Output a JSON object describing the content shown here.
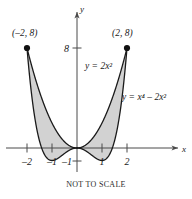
{
  "figure": {
    "caption": "NOT TO SCALE",
    "axes": {
      "x_axis_label": "x",
      "y_axis_label": "y",
      "x_ticks": [
        {
          "value": -2,
          "label": "–2"
        },
        {
          "value": -1,
          "label": "–1"
        },
        {
          "value": 1,
          "label": "1"
        },
        {
          "value": 2,
          "label": "2"
        }
      ],
      "y_ticks": [
        {
          "value": 8,
          "label": "8"
        },
        {
          "value": -1,
          "label": "–1"
        }
      ]
    },
    "curve_labels": {
      "parabola": "y = 2x²",
      "quartic": "y = x⁴ – 2x²"
    },
    "points": [
      {
        "label": "(–2, 8)",
        "x": -2,
        "y": 8
      },
      {
        "label": "(2, 8)",
        "x": 2,
        "y": 8
      }
    ],
    "colors": {
      "shading": "#d2d2d2",
      "curve": "#1a1a1a",
      "axis": "#4a4a4a"
    }
  },
  "chart_data": {
    "type": "line",
    "title": "",
    "subtitle": "NOT TO SCALE",
    "xlabel": "x",
    "ylabel": "y",
    "xlim": [
      -2.6,
      2.6
    ],
    "ylim": [
      -1.6,
      9.2
    ],
    "grid": false,
    "legend": "inline-curve-labels",
    "x": [
      -2,
      -1.75,
      -1.5,
      -1.25,
      -1,
      -0.75,
      -0.5,
      -0.25,
      0,
      0.25,
      0.5,
      0.75,
      1,
      1.25,
      1.5,
      1.75,
      2
    ],
    "series": [
      {
        "name": "y = 2x²",
        "expression": "2*x^2",
        "values": [
          8,
          6.125,
          4.5,
          3.125,
          2,
          1.125,
          0.5,
          0.125,
          0,
          0.125,
          0.5,
          1.125,
          2,
          3.125,
          4.5,
          6.125,
          8
        ]
      },
      {
        "name": "y = x⁴ – 2x²",
        "expression": "x^4 - 2*x^2",
        "values": [
          8,
          3.254,
          -1.406,
          -1.685,
          -1,
          -0.809,
          -0.4375,
          -0.1211,
          0,
          -0.1211,
          -0.4375,
          -0.809,
          -1,
          -1.685,
          -1.406,
          3.254,
          8
        ]
      }
    ],
    "annotations": [
      {
        "text": "(–2, 8)",
        "x": -2,
        "y": 8
      },
      {
        "text": "(2, 8)",
        "x": 2,
        "y": 8
      },
      {
        "text": "y = 2x²",
        "x": 0.55,
        "y": 5.4
      },
      {
        "text": "y = x⁴ – 2x²",
        "x": 1.55,
        "y": 2.7
      }
    ],
    "shaded_region": {
      "description": "Region between y = 2x² and y = x⁴ – 2x² from x = –2 to x = 2",
      "color": "#d2d2d2"
    }
  }
}
